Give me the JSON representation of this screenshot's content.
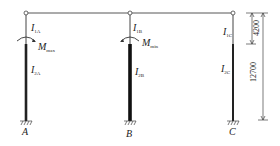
{
  "diagram": {
    "columns": [
      {
        "id": "A",
        "label": "A",
        "upper_inertia": {
          "main": "I",
          "sub": "1A"
        },
        "lower_inertia": {
          "main": "I",
          "sub": "2A"
        },
        "moment": {
          "main": "M",
          "sub": "max"
        }
      },
      {
        "id": "B",
        "label": "B",
        "upper_inertia": {
          "main": "I",
          "sub": "1B"
        },
        "lower_inertia": {
          "main": "I",
          "sub": "2B"
        },
        "moment": {
          "main": "M",
          "sub": "min"
        }
      },
      {
        "id": "C",
        "label": "C",
        "upper_inertia": {
          "main": "I",
          "sub": "1C"
        },
        "lower_inertia": {
          "main": "I",
          "sub": "2C"
        }
      }
    ],
    "dimensions": {
      "upper_height": "4200",
      "total_height": "12700"
    },
    "colors": {
      "line": "#333333",
      "column_lower": "#222222"
    }
  }
}
